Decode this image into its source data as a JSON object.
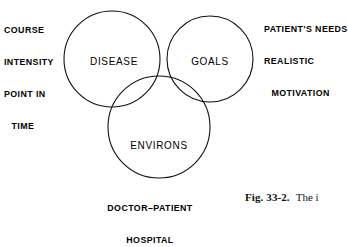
{
  "figure": {
    "type": "venn-diagram-three-circle",
    "background_color": "#ffffff",
    "stroke_color": "#111111",
    "circles": [
      {
        "id": "disease",
        "label": "DISEASE",
        "cx": 112,
        "cy": 59,
        "r": 48
      },
      {
        "id": "goals",
        "label": "GOALS",
        "cx": 210,
        "cy": 59,
        "r": 43
      },
      {
        "id": "environs",
        "label": "ENVIRONS",
        "cx": 159,
        "cy": 127,
        "r": 51
      }
    ]
  },
  "annotations": {
    "left": {
      "name": "course-intensity-annotation",
      "lines": [
        "COURSE",
        "INTENSITY",
        "POINT IN",
        "TIME"
      ]
    },
    "right": {
      "name": "patients-needs-annotation",
      "lines": [
        "PATIENT'S NEEDS",
        "REALISTIC",
        "MOTIVATION"
      ]
    },
    "bottom": {
      "name": "doctor-patient-annotation",
      "lines": [
        "DOCTOR–PATIENT",
        "HOSPITAL"
      ]
    }
  },
  "caption": {
    "number": "Fig. 33-2.",
    "text": "The i"
  }
}
